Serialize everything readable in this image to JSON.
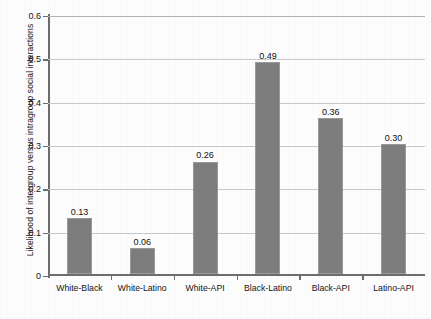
{
  "chart_data": {
    "type": "bar",
    "title": "",
    "xlabel": "",
    "ylabel": "Likelihood of intergroup versus intragroup social interactions",
    "categories": [
      "White-Black",
      "White-Latino",
      "White-API",
      "Black-Latino",
      "Black-API",
      "Latino-API"
    ],
    "values": [
      0.13,
      0.06,
      0.26,
      0.49,
      0.36,
      0.3
    ],
    "value_labels": [
      "0.13",
      "0.06",
      "0.26",
      "0.49",
      "0.36",
      "0.30"
    ],
    "ylim": [
      0,
      0.6
    ],
    "ytick_labels": [
      "0",
      "0.1",
      "0.2",
      "0.3",
      "0.4",
      "0.5",
      "0.6"
    ],
    "ytick_values": [
      0,
      0.1,
      0.2,
      0.3,
      0.4,
      0.5,
      0.6
    ],
    "grid": "horizontal",
    "legend": "none",
    "bar_color": "#7d7d7d",
    "grid_color": "#c9c9c9",
    "axis_color": "#6d6d6d"
  }
}
